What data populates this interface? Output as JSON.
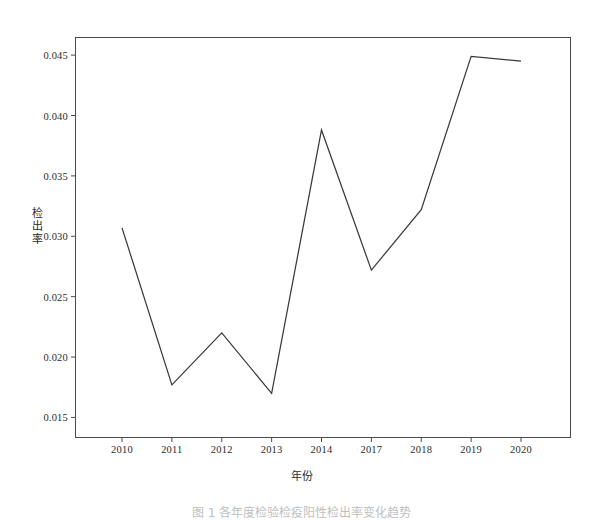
{
  "figure": {
    "caption": "图 1  各年度检验检疫阳性检出率变化趋势",
    "background_color": "#ffffff",
    "line_color": "#3a3a3a",
    "frame_color": "#4a4a4a"
  },
  "axes": {
    "x_title": "年份",
    "y_title_chars": [
      "检",
      "出",
      "率"
    ],
    "y_title": "检出率",
    "x_tick_labels": [
      "2010",
      "2011",
      "2012",
      "2013",
      "2014",
      "2017",
      "2018",
      "2019",
      "2020"
    ],
    "y_tick_labels": [
      "0.045",
      "0.040",
      "0.035",
      "0.030",
      "0.025",
      "0.020",
      "0.015"
    ]
  },
  "chart_data": {
    "type": "line",
    "title": "",
    "xlabel": "年份",
    "ylabel": "检出率",
    "categories": [
      "2010",
      "2011",
      "2012",
      "2013",
      "2014",
      "2017",
      "2018",
      "2019",
      "2020"
    ],
    "values": [
      0.0307,
      0.0177,
      0.022,
      0.017,
      0.0388,
      0.0272,
      0.0322,
      0.0449,
      0.0445
    ],
    "ylim": [
      0.0133,
      0.0465
    ],
    "yticks": [
      0.015,
      0.02,
      0.025,
      0.03,
      0.035,
      0.04,
      0.045
    ],
    "grid": false,
    "legend": "none",
    "series": [
      {
        "name": "检出率",
        "values": [
          0.0307,
          0.0177,
          0.022,
          0.017,
          0.0388,
          0.0272,
          0.0322,
          0.0449,
          0.0445
        ]
      }
    ]
  }
}
